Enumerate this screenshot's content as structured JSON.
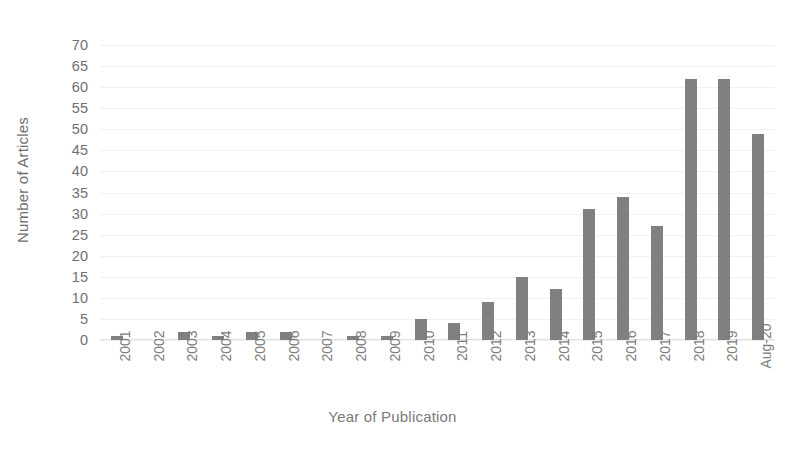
{
  "chart_data": {
    "type": "bar",
    "title": "",
    "xlabel": "Year of Publication",
    "ylabel": "Number of Articles",
    "categories": [
      "2001",
      "2002",
      "2003",
      "2004",
      "2005",
      "2006",
      "2007",
      "2008",
      "2009",
      "2010",
      "2011",
      "2012",
      "2013",
      "2014",
      "2015",
      "2016",
      "2017",
      "2018",
      "2019",
      "Aug-20"
    ],
    "values": [
      1,
      0,
      2,
      1,
      2,
      2,
      0,
      1,
      1,
      5,
      4,
      9,
      15,
      12,
      31,
      34,
      27,
      62,
      62,
      49
    ],
    "ylim": [
      0,
      70
    ],
    "ytick_step": 5,
    "yticks": [
      0,
      5,
      10,
      15,
      20,
      25,
      30,
      35,
      40,
      45,
      50,
      55,
      60,
      65,
      70
    ],
    "grid": true,
    "legend": "none",
    "series": [
      {
        "name": "Number of Articles",
        "values": [
          1,
          0,
          2,
          1,
          2,
          2,
          0,
          1,
          1,
          5,
          4,
          9,
          15,
          12,
          31,
          34,
          27,
          62,
          62,
          49
        ]
      }
    ],
    "colors": {
      "bar": "#808080",
      "grid": "#f0f0f0",
      "text": "#6f6f6f",
      "background": "#ffffff"
    }
  }
}
